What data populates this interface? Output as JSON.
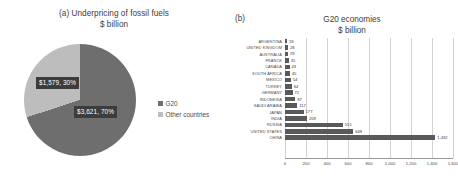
{
  "panel_a": {
    "marker": "(a)",
    "title": "Underpricing of fossil fuels",
    "subtitle": "$ billion",
    "labels": {
      "other": "$1,579, 30%",
      "g20": "$3,621, 70%"
    },
    "legend": [
      {
        "label": "G20",
        "color": "#6e6e6e"
      },
      {
        "label": "Other countries",
        "color": "#bdbdbd"
      }
    ]
  },
  "panel_b": {
    "marker": "(b)",
    "title": "G20 economies",
    "subtitle": "$ billion"
  },
  "chart_data": [
    {
      "type": "pie",
      "title": "(a) Underpricing of fossil fuels",
      "subtitle": "$ billion",
      "unit": "$ billion",
      "legend_position": "right",
      "slices": [
        {
          "name": "G20",
          "value": 3621,
          "percent": 70,
          "label": "$3,621, 70%",
          "color": "#6e6e6e"
        },
        {
          "name": "Other countries",
          "value": 1579,
          "percent": 30,
          "label": "$1,579, 30%",
          "color": "#bdbdbd"
        }
      ]
    },
    {
      "type": "bar",
      "orientation": "horizontal",
      "title": "G20 economies",
      "subtitle": "$ billion",
      "xlabel": "",
      "ylabel": "",
      "xlim": [
        0,
        1600
      ],
      "grid": true,
      "xticks": [
        0,
        200,
        400,
        600,
        800,
        1000,
        1200,
        1400,
        1600
      ],
      "xtick_labels": [
        "0",
        "200",
        "400",
        "600",
        "800",
        "1,000",
        "1,200",
        "1,400",
        "1,600"
      ],
      "bar_color": "#595959",
      "categories": [
        "ARGENTINA",
        "UNITED KINGDOM",
        "AUSTRALIA",
        "FRANCE",
        "CANADA",
        "SOUTH AFRICA",
        "MEXICO",
        "TURKEY",
        "GERMANY",
        "INDONESIA",
        "SAUDI ARABIA",
        "JAPAN",
        "INDIA",
        "RUSSIA",
        "UNITED STATES",
        "CHINA"
      ],
      "values": [
        19,
        28,
        29,
        35,
        43,
        45,
        54,
        64,
        72,
        97,
        117,
        177,
        209,
        551,
        649,
        1432
      ],
      "value_labels": [
        "19",
        "28",
        "29",
        "35",
        "43",
        "45",
        "54",
        "64",
        "72",
        "97",
        "117",
        "177",
        "209",
        "551",
        "649",
        "1,432"
      ]
    }
  ]
}
